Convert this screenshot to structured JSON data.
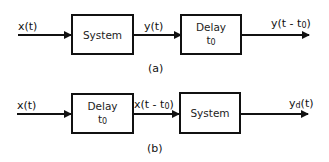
{
  "diagram_a": {
    "caption": "(a)",
    "input_label": "x(t)",
    "block1": {
      "label": "System"
    },
    "mid_label": "y(t)",
    "block2": {
      "label": "Delay",
      "param_base": "t",
      "param_sub": "0"
    },
    "output_label_prefix": "y(t - t",
    "output_label_sub": "0",
    "output_label_suffix": ")"
  },
  "diagram_b": {
    "caption": "(b)",
    "input_label": "x(t)",
    "block1": {
      "label": "Delay",
      "param_base": "t",
      "param_sub": "0"
    },
    "mid_label_prefix": "x(t - t",
    "mid_label_sub": "0",
    "mid_label_suffix": ")",
    "block2": {
      "label": "System"
    },
    "output_label_base": "y",
    "output_label_sub": "d",
    "output_label_suffix": "(t)"
  },
  "colors": {
    "stroke": "#111111",
    "background": "#ffffff"
  }
}
